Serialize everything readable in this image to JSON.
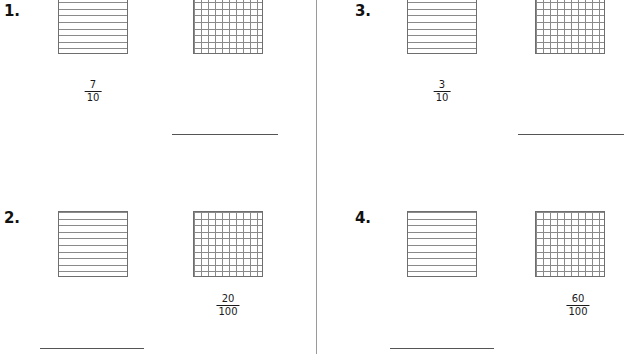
{
  "worksheet": {
    "divider_color": "#9a9a9a",
    "grid_line_color": "#8a8a8a",
    "grid_border_color": "#6e6e6e",
    "blank_line_color": "#555555"
  },
  "problems": [
    {
      "number": "1.",
      "tenths_grid": {
        "rows": 10,
        "cols": 1,
        "shaded": 0
      },
      "hundredths_grid": {
        "rows": 10,
        "cols": 10,
        "shaded": 0
      },
      "fraction": {
        "numerator": "7",
        "denominator": "10",
        "under": "tenths"
      },
      "answer_blank": {
        "under": "hundredths",
        "value": ""
      }
    },
    {
      "number": "2.",
      "tenths_grid": {
        "rows": 10,
        "cols": 1,
        "shaded": 0
      },
      "hundredths_grid": {
        "rows": 10,
        "cols": 10,
        "shaded": 0
      },
      "fraction": {
        "numerator": "20",
        "denominator": "100",
        "under": "hundredths"
      },
      "answer_blank": {
        "under": "tenths",
        "value": ""
      }
    },
    {
      "number": "3.",
      "tenths_grid": {
        "rows": 10,
        "cols": 1,
        "shaded": 0
      },
      "hundredths_grid": {
        "rows": 10,
        "cols": 10,
        "shaded": 0
      },
      "fraction": {
        "numerator": "3",
        "denominator": "10",
        "under": "tenths"
      },
      "answer_blank": {
        "under": "hundredths",
        "value": ""
      }
    },
    {
      "number": "4.",
      "tenths_grid": {
        "rows": 10,
        "cols": 1,
        "shaded": 0
      },
      "hundredths_grid": {
        "rows": 10,
        "cols": 10,
        "shaded": 0
      },
      "fraction": {
        "numerator": "60",
        "denominator": "100",
        "under": "hundredths"
      },
      "answer_blank": {
        "under": "tenths",
        "value": ""
      }
    }
  ]
}
